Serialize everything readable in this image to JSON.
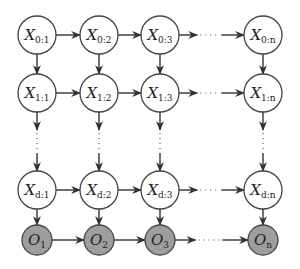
{
  "diagram": {
    "type": "graphical-model-lattice",
    "columns": [
      {
        "key": "1",
        "x": 37
      },
      {
        "key": "2",
        "x": 99
      },
      {
        "key": "3",
        "x": 160
      },
      {
        "key": "n",
        "x": 263
      }
    ],
    "rows": [
      {
        "id": "row-0",
        "kind": "hidden",
        "level": "0",
        "y": 35
      },
      {
        "id": "row-1",
        "kind": "hidden",
        "level": "1",
        "y": 93
      },
      {
        "id": "row-d",
        "kind": "hidden",
        "level": "d",
        "y": 190
      },
      {
        "id": "row-o",
        "kind": "observed",
        "level": "",
        "y": 240
      }
    ],
    "hidden_symbol": "X",
    "observed_symbol": "O",
    "hidden_radius": 19,
    "observed_radius": 15,
    "colors": {
      "hidden_fill": "#ffffff",
      "observed_fill": "#9e9e9e",
      "stroke": "#444444",
      "edge": "#333333"
    },
    "nodes": [
      {
        "id": "X0_1",
        "main": "X",
        "sub": "0:1",
        "row": 0,
        "col": 0
      },
      {
        "id": "X0_2",
        "main": "X",
        "sub": "0:2",
        "row": 0,
        "col": 1
      },
      {
        "id": "X0_3",
        "main": "X",
        "sub": "0:3",
        "row": 0,
        "col": 2
      },
      {
        "id": "X0_n",
        "main": "X",
        "sub": "0:n",
        "row": 0,
        "col": 3
      },
      {
        "id": "X1_1",
        "main": "X",
        "sub": "1:1",
        "row": 1,
        "col": 0
      },
      {
        "id": "X1_2",
        "main": "X",
        "sub": "1:2",
        "row": 1,
        "col": 1
      },
      {
        "id": "X1_3",
        "main": "X",
        "sub": "1:3",
        "row": 1,
        "col": 2
      },
      {
        "id": "X1_n",
        "main": "X",
        "sub": "1:n",
        "row": 1,
        "col": 3
      },
      {
        "id": "Xd_1",
        "main": "X",
        "sub": "d:1",
        "row": 2,
        "col": 0
      },
      {
        "id": "Xd_2",
        "main": "X",
        "sub": "d:2",
        "row": 2,
        "col": 1
      },
      {
        "id": "Xd_3",
        "main": "X",
        "sub": "d:3",
        "row": 2,
        "col": 2
      },
      {
        "id": "Xd_n",
        "main": "X",
        "sub": "d:n",
        "row": 2,
        "col": 3
      },
      {
        "id": "O_1",
        "main": "O",
        "sub": "1",
        "row": 3,
        "col": 0
      },
      {
        "id": "O_2",
        "main": "O",
        "sub": "2",
        "row": 3,
        "col": 1
      },
      {
        "id": "O_3",
        "main": "O",
        "sub": "3",
        "row": 3,
        "col": 2
      },
      {
        "id": "O_n",
        "main": "O",
        "sub": "n",
        "row": 3,
        "col": 3
      }
    ],
    "horizontal_edges": "each row: col1→col2, col2→col3 solid; col3→coln with ellipsis (··· )",
    "vertical_edges": "each column: row0→row1 solid; row1→rowd via vertical ellipsis (⋮); rowd→O solid"
  }
}
